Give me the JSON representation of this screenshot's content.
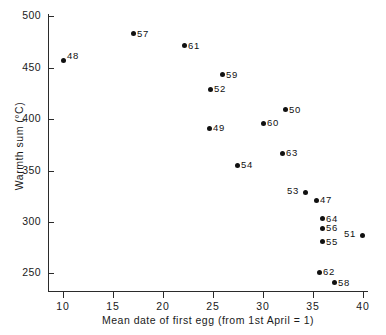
{
  "chart_data": {
    "type": "scatter",
    "title": "",
    "xlabel": "Mean date of first egg (from 1st April = 1)",
    "ylabel": "Warmth sum (°C)",
    "xlim": [
      8.5,
      40.5
    ],
    "ylim": [
      232,
      502
    ],
    "xticks": [
      10,
      15,
      20,
      25,
      30,
      35,
      40
    ],
    "xtick_labels": [
      "10",
      "15",
      "20",
      "25",
      "30",
      "35",
      "40"
    ],
    "yticks": [
      250,
      300,
      350,
      400,
      450,
      500
    ],
    "ytick_labels": [
      "250",
      "300",
      "350",
      "400",
      "450",
      "500"
    ],
    "grid": false,
    "legend": "none",
    "point_label_field": "year",
    "points": [
      {
        "year": "48",
        "x": 10.0,
        "y": 457,
        "label_pos": "upper-right"
      },
      {
        "year": "57",
        "x": 17.0,
        "y": 483,
        "label_pos": "right"
      },
      {
        "year": "61",
        "x": 22.1,
        "y": 471,
        "label_pos": "right"
      },
      {
        "year": "59",
        "x": 25.9,
        "y": 443,
        "label_pos": "right"
      },
      {
        "year": "52",
        "x": 24.7,
        "y": 429,
        "label_pos": "right"
      },
      {
        "year": "50",
        "x": 32.2,
        "y": 409,
        "label_pos": "right"
      },
      {
        "year": "60",
        "x": 30.0,
        "y": 396,
        "label_pos": "right"
      },
      {
        "year": "49",
        "x": 24.6,
        "y": 391,
        "label_pos": "right"
      },
      {
        "year": "63",
        "x": 31.9,
        "y": 367,
        "label_pos": "right"
      },
      {
        "year": "54",
        "x": 27.4,
        "y": 355,
        "label_pos": "right"
      },
      {
        "year": "53",
        "x": 34.2,
        "y": 329,
        "label_pos": "left"
      },
      {
        "year": "47",
        "x": 35.3,
        "y": 321,
        "label_pos": "right"
      },
      {
        "year": "64",
        "x": 35.9,
        "y": 303,
        "label_pos": "right"
      },
      {
        "year": "56",
        "x": 35.9,
        "y": 294,
        "label_pos": "right"
      },
      {
        "year": "55",
        "x": 35.9,
        "y": 281,
        "label_pos": "right"
      },
      {
        "year": "51",
        "x": 39.9,
        "y": 287,
        "label_pos": "left"
      },
      {
        "year": "62",
        "x": 35.6,
        "y": 251,
        "label_pos": "right"
      },
      {
        "year": "58",
        "x": 37.1,
        "y": 241,
        "label_pos": "right"
      }
    ]
  }
}
